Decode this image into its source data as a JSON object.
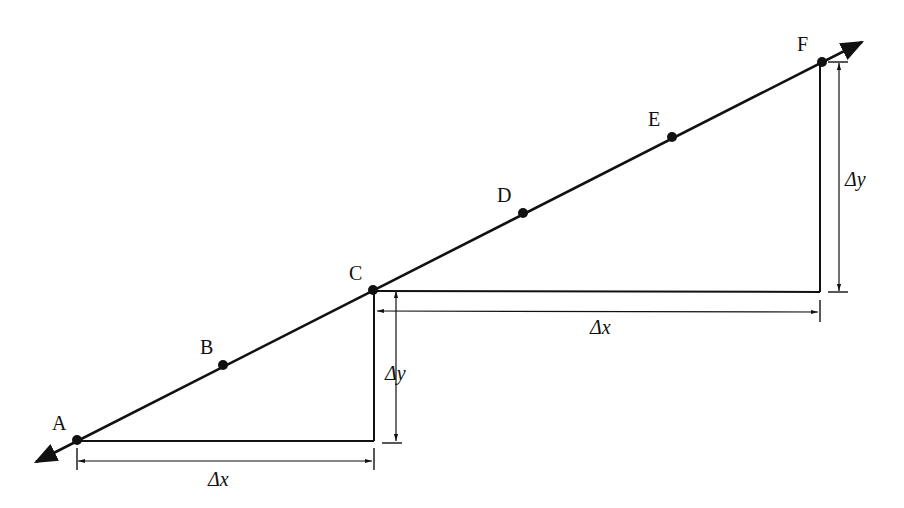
{
  "diagram": {
    "type": "slope-of-line",
    "line": {
      "start": [
        36,
        462
      ],
      "end": [
        862,
        42
      ],
      "color": "#111111",
      "arrows": "both"
    },
    "points": [
      {
        "label": "A",
        "x": 77,
        "y": 440,
        "lx": 52,
        "ly": 430
      },
      {
        "label": "B",
        "x": 223,
        "y": 365,
        "lx": 200,
        "ly": 354
      },
      {
        "label": "C",
        "x": 373,
        "y": 290,
        "lx": 349,
        "ly": 280
      },
      {
        "label": "D",
        "x": 523,
        "y": 213,
        "lx": 497,
        "ly": 202
      },
      {
        "label": "E",
        "x": 672,
        "y": 137,
        "lx": 648,
        "ly": 126
      },
      {
        "label": "F",
        "x": 822,
        "y": 62,
        "lx": 797,
        "ly": 51
      }
    ],
    "triangles": [
      {
        "name": "A-to-C",
        "run_label": "Δx",
        "rise_label": "Δy",
        "run_text_pos": [
          208,
          486
        ],
        "rise_text_pos": [
          385,
          380
        ]
      },
      {
        "name": "C-to-F",
        "run_label": "Δx",
        "rise_label": "Δy",
        "run_text_pos": [
          590,
          334
        ],
        "rise_text_pos": [
          838,
          186
        ]
      }
    ],
    "labels": {
      "delta": "Δ",
      "x": "x",
      "y": "y"
    }
  }
}
